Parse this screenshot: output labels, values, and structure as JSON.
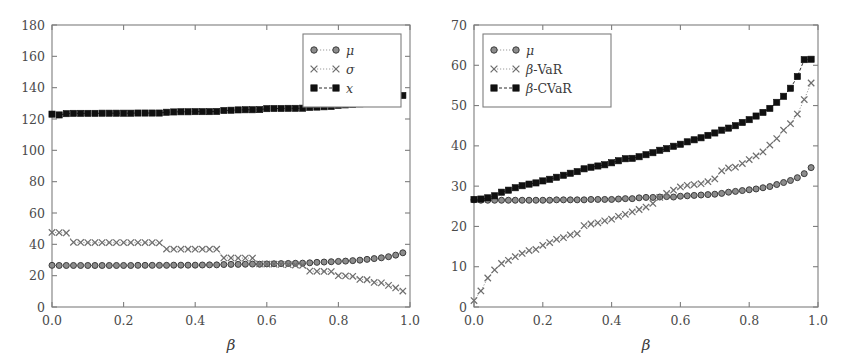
{
  "figure": {
    "title": "",
    "background": "#ffffff",
    "panels": [
      "left",
      "right"
    ]
  },
  "colors": {
    "axis": "#7e7e7e",
    "text": "#3a3a3a",
    "mu_marker": "#8c8c8c",
    "sigma_marker": "#6e6e6e",
    "x_marker": "#101010",
    "dotted_line": "#9a9a9a",
    "dashed_line": "#2b2b2b"
  },
  "chart_data": [
    {
      "type": "scatter",
      "panel": "left",
      "title": "",
      "xlabel": "β",
      "ylabel": "",
      "xlim": [
        0.0,
        1.0
      ],
      "ylim": [
        0,
        180
      ],
      "xticks": [
        0.0,
        0.2,
        0.4,
        0.6,
        0.8,
        1.0
      ],
      "xticklabels": [
        "0.0",
        "0.2",
        "0.4",
        "0.6",
        "0.8",
        "1.0"
      ],
      "yticks": [
        0,
        20,
        40,
        60,
        80,
        100,
        120,
        140,
        160,
        180
      ],
      "yticklabels": [
        "0",
        "20",
        "40",
        "60",
        "80",
        "100",
        "120",
        "140",
        "160",
        "180"
      ],
      "grid": false,
      "legend_position": "upper right",
      "x": [
        0.0,
        0.02,
        0.04,
        0.06,
        0.08,
        0.1,
        0.12,
        0.14,
        0.16,
        0.18,
        0.2,
        0.22,
        0.24,
        0.26,
        0.28,
        0.3,
        0.32,
        0.34,
        0.36,
        0.38,
        0.4,
        0.42,
        0.44,
        0.46,
        0.48,
        0.5,
        0.52,
        0.54,
        0.56,
        0.58,
        0.6,
        0.62,
        0.64,
        0.66,
        0.68,
        0.7,
        0.72,
        0.74,
        0.76,
        0.78,
        0.8,
        0.82,
        0.84,
        0.86,
        0.88,
        0.9,
        0.92,
        0.94,
        0.96,
        0.98
      ],
      "series": [
        {
          "name": "μ",
          "marker": "circle",
          "line": "dotted",
          "color": "#8c8c8c",
          "values": [
            26.6,
            26.5,
            26.5,
            26.5,
            26.5,
            26.5,
            26.5,
            26.5,
            26.5,
            26.5,
            26.5,
            26.5,
            26.6,
            26.6,
            26.6,
            26.6,
            26.6,
            26.7,
            26.7,
            26.7,
            26.7,
            26.8,
            26.9,
            26.9,
            27.1,
            27.2,
            27.2,
            27.3,
            27.4,
            27.3,
            27.5,
            27.6,
            27.7,
            27.8,
            27.9,
            28.0,
            28.2,
            28.5,
            28.7,
            28.9,
            29.1,
            29.3,
            29.6,
            29.9,
            30.4,
            30.9,
            31.4,
            32.1,
            33.1,
            34.6
          ]
        },
        {
          "name": "σ",
          "marker": "x",
          "line": "dotted",
          "color": "#6e6e6e",
          "values": [
            47.6,
            47.5,
            47.3,
            41.3,
            41.2,
            41.1,
            41.1,
            41.1,
            41.1,
            41.1,
            41.1,
            41.1,
            41.1,
            41.1,
            41.1,
            41.0,
            37.0,
            36.9,
            36.9,
            36.9,
            36.9,
            36.9,
            36.9,
            36.9,
            31.3,
            31.3,
            31.2,
            31.2,
            31.2,
            27.5,
            27.4,
            27.3,
            27.2,
            27.0,
            26.8,
            26.6,
            22.9,
            22.8,
            22.7,
            22.6,
            20.0,
            19.8,
            19.6,
            17.6,
            17.4,
            15.7,
            15.4,
            13.8,
            12.2,
            10.2
          ]
        },
        {
          "name": "x",
          "marker": "square",
          "line": "dashed",
          "color": "#101010",
          "values": [
            123.1,
            122.6,
            123.4,
            123.6,
            123.6,
            123.6,
            123.6,
            123.7,
            123.7,
            123.7,
            123.7,
            123.7,
            123.8,
            123.8,
            123.8,
            123.8,
            124.3,
            124.5,
            124.6,
            124.6,
            124.7,
            124.7,
            124.7,
            124.8,
            125.4,
            125.6,
            125.8,
            125.9,
            125.9,
            126.0,
            126.6,
            126.7,
            126.7,
            126.8,
            126.8,
            126.9,
            127.4,
            127.6,
            127.8,
            128.0,
            128.7,
            129.0,
            129.3,
            129.7,
            130.5,
            131.2,
            131.8,
            132.5,
            133.6,
            135.0
          ]
        }
      ]
    },
    {
      "type": "scatter",
      "panel": "right",
      "title": "",
      "xlabel": "β",
      "ylabel": "",
      "xlim": [
        0.0,
        1.0
      ],
      "ylim": [
        0,
        70
      ],
      "xticks": [
        0.0,
        0.2,
        0.4,
        0.6,
        0.8,
        1.0
      ],
      "xticklabels": [
        "0.0",
        "0.2",
        "0.4",
        "0.6",
        "0.8",
        "1.0"
      ],
      "yticks": [
        0,
        10,
        20,
        30,
        40,
        50,
        60,
        70
      ],
      "yticklabels": [
        "0",
        "10",
        "20",
        "30",
        "40",
        "50",
        "60",
        "70"
      ],
      "grid": false,
      "legend_position": "upper left",
      "x": [
        0.0,
        0.02,
        0.04,
        0.06,
        0.08,
        0.1,
        0.12,
        0.14,
        0.16,
        0.18,
        0.2,
        0.22,
        0.24,
        0.26,
        0.28,
        0.3,
        0.32,
        0.34,
        0.36,
        0.38,
        0.4,
        0.42,
        0.44,
        0.46,
        0.48,
        0.5,
        0.52,
        0.54,
        0.56,
        0.58,
        0.6,
        0.62,
        0.64,
        0.66,
        0.68,
        0.7,
        0.72,
        0.74,
        0.76,
        0.78,
        0.8,
        0.82,
        0.84,
        0.86,
        0.88,
        0.9,
        0.92,
        0.94,
        0.96,
        0.98
      ],
      "series": [
        {
          "name": "μ",
          "marker": "circle",
          "line": "dotted",
          "color": "#8c8c8c",
          "values": [
            26.6,
            26.5,
            26.5,
            26.5,
            26.5,
            26.5,
            26.5,
            26.5,
            26.5,
            26.5,
            26.5,
            26.5,
            26.6,
            26.6,
            26.6,
            26.6,
            26.6,
            26.7,
            26.7,
            26.7,
            26.7,
            26.8,
            26.9,
            26.9,
            27.1,
            27.2,
            27.2,
            27.3,
            27.4,
            27.3,
            27.5,
            27.6,
            27.7,
            27.8,
            27.9,
            28.0,
            28.2,
            28.5,
            28.7,
            28.9,
            29.1,
            29.3,
            29.6,
            29.9,
            30.4,
            30.9,
            31.4,
            32.1,
            33.1,
            34.6
          ]
        },
        {
          "name": "β-VaR",
          "marker": "x",
          "line": "dotted",
          "color": "#6e6e6e",
          "values": [
            1.6,
            4.0,
            7.2,
            9.2,
            10.8,
            11.6,
            12.5,
            13.3,
            14.0,
            14.3,
            15.3,
            16.0,
            16.8,
            17.2,
            17.9,
            18.2,
            20.2,
            20.6,
            20.9,
            21.4,
            21.8,
            22.5,
            23.0,
            23.6,
            24.2,
            24.8,
            25.7,
            27.2,
            28.2,
            29.0,
            29.8,
            30.2,
            30.4,
            30.6,
            31.1,
            31.8,
            33.8,
            34.5,
            34.7,
            35.6,
            36.6,
            37.5,
            38.5,
            40.2,
            41.8,
            43.9,
            45.5,
            47.9,
            51.5,
            55.6
          ]
        },
        {
          "name": "β-CVaR",
          "marker": "square",
          "line": "dashed",
          "color": "#101010",
          "values": [
            26.7,
            26.8,
            27.1,
            27.6,
            28.5,
            29.0,
            29.6,
            30.1,
            30.5,
            30.8,
            31.3,
            31.7,
            32.2,
            32.7,
            33.2,
            33.6,
            34.3,
            34.7,
            35.0,
            35.3,
            35.8,
            36.3,
            36.8,
            36.9,
            37.3,
            37.8,
            38.3,
            38.9,
            39.3,
            39.9,
            40.4,
            41.0,
            41.5,
            42.0,
            42.6,
            43.2,
            43.9,
            44.4,
            45.0,
            45.8,
            46.5,
            47.4,
            48.3,
            49.3,
            50.8,
            52.3,
            54.3,
            57.2,
            61.4,
            61.5
          ]
        }
      ]
    }
  ]
}
